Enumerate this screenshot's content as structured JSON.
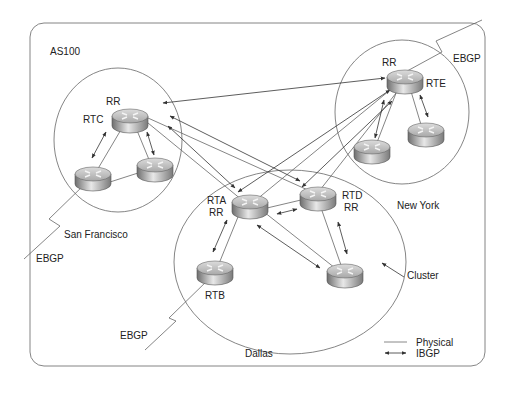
{
  "diagram": {
    "as_label": "AS100",
    "clusters": [
      {
        "id": "sf",
        "name": "San Francisco",
        "cx": 118,
        "cy": 140,
        "rx": 64,
        "ry": 72
      },
      {
        "id": "ny",
        "name": "New York",
        "cx": 402,
        "cy": 112,
        "rx": 67,
        "ry": 72
      },
      {
        "id": "dallas",
        "name": "Dallas",
        "cx": 290,
        "cy": 262,
        "rx": 116,
        "ry": 92
      }
    ],
    "routers": [
      {
        "id": "sf-rr",
        "cx": 130,
        "cy": 120,
        "labels": [
          "RR",
          "RTC"
        ]
      },
      {
        "id": "sf-left",
        "cx": 93,
        "cy": 178,
        "labels": []
      },
      {
        "id": "sf-right",
        "cx": 155,
        "cy": 169,
        "labels": []
      },
      {
        "id": "ny-rr",
        "cx": 405,
        "cy": 81,
        "labels": [
          "RR",
          "RTE"
        ]
      },
      {
        "id": "ny-left",
        "cx": 372,
        "cy": 151,
        "labels": []
      },
      {
        "id": "ny-right",
        "cx": 426,
        "cy": 134,
        "labels": []
      },
      {
        "id": "rta",
        "cx": 250,
        "cy": 206,
        "labels": [
          "RTA",
          "RR"
        ]
      },
      {
        "id": "rtd",
        "cx": 318,
        "cy": 198,
        "labels": [
          "RTD",
          "RR"
        ]
      },
      {
        "id": "rtb",
        "cx": 215,
        "cy": 272,
        "labels": [
          "RTB"
        ]
      },
      {
        "id": "dallas-bottom",
        "cx": 345,
        "cy": 275,
        "labels": []
      }
    ],
    "labels": {
      "sf_rr": "RR",
      "rtc": "RTC",
      "ny_rr": "RR",
      "rte": "RTE",
      "rta": "RTA",
      "rta_rr": "RR",
      "rtd": "RTD",
      "rtd_rr": "RR",
      "rtb": "RTB",
      "san_francisco": "San Francisco",
      "new_york": "New York",
      "dallas": "Dallas",
      "cluster": "Cluster",
      "ebgp_ny": "EBGP",
      "ebgp_sf": "EBGP",
      "ebgp_dallas": "EBGP"
    },
    "legend": {
      "physical": "Physical",
      "ibgp": "IBGP"
    },
    "colors": {
      "line": "#555555",
      "border": "#666666",
      "router_top": "#c8c8c8",
      "router_side_dark": "#6e6e6e",
      "router_side_light": "#e6e6e6"
    }
  }
}
